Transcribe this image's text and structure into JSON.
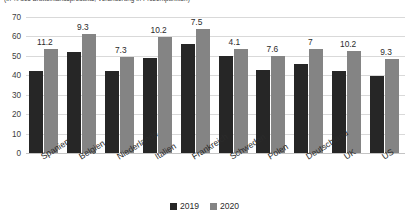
{
  "chart_data": {
    "type": "bar",
    "title": "(in % des Bruttoinlandsprodukts, Veränderung in Prozentpunkten)",
    "xlabel": "",
    "ylabel": "",
    "ylim": [
      0,
      70
    ],
    "yticks": [
      0,
      10,
      20,
      30,
      40,
      50,
      60,
      70
    ],
    "grid": true,
    "legend_position": "bottom",
    "categories": [
      "Spanien",
      "Belgien",
      "Niederlande",
      "Italien",
      "Frankreich",
      "Schweden",
      "Polen",
      "Deutschland",
      "UK",
      "US"
    ],
    "series": [
      {
        "name": "2019",
        "color": "#262626",
        "values": [
          42,
          52,
          42,
          49,
          56,
          50,
          42.5,
          46,
          42,
          39.5
        ]
      },
      {
        "name": "2020",
        "color": "#848484",
        "values": [
          53.5,
          61.5,
          49.5,
          59.5,
          64,
          53.5,
          50,
          53.5,
          52.5,
          48.5
        ]
      }
    ],
    "annotations": {
      "label": "Veränderung 2019 zu 2020 in Prozentpunkten",
      "values": [
        "11.2",
        "9.3",
        "7.3",
        "10.2",
        "7.5",
        "4.1",
        "7.6",
        "7",
        "10.2",
        "9.3"
      ]
    }
  },
  "legend": {
    "items": [
      {
        "label": "2019",
        "color": "#262626"
      },
      {
        "label": "2020",
        "color": "#848484"
      }
    ]
  }
}
